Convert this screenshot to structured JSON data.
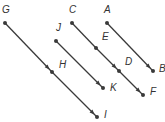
{
  "diagram": {
    "type": "parallel-directed-segments",
    "colors": {
      "line": "#3a3a3a",
      "label": "#333333",
      "background": "#ffffff"
    },
    "points": {
      "A": {
        "x": 107,
        "y": 23,
        "label": "A",
        "lx": 104,
        "ly": 13
      },
      "B": {
        "x": 153,
        "y": 71,
        "label": "B",
        "lx": 159,
        "ly": 72
      },
      "C": {
        "x": 72,
        "y": 23,
        "label": "C",
        "lx": 69,
        "ly": 13
      },
      "E": {
        "x": 96,
        "y": 48,
        "label": "E",
        "lx": 102,
        "ly": 40
      },
      "D": {
        "x": 119,
        "y": 71,
        "label": "D",
        "lx": 125,
        "ly": 65
      },
      "F": {
        "x": 143,
        "y": 95,
        "label": "F",
        "lx": 150,
        "ly": 95
      },
      "J": {
        "x": 56,
        "y": 41,
        "label": "J",
        "lx": 56,
        "ly": 31
      },
      "K": {
        "x": 103,
        "y": 88,
        "label": "K",
        "lx": 110,
        "ly": 91
      },
      "G": {
        "x": 5,
        "y": 23,
        "label": "G",
        "lx": 2,
        "ly": 13
      },
      "H": {
        "x": 52,
        "y": 72,
        "label": "H",
        "lx": 59,
        "ly": 68
      },
      "I": {
        "x": 97,
        "y": 117,
        "label": "I",
        "lx": 104,
        "ly": 118
      }
    },
    "vectors": [
      {
        "name": "vector-AB",
        "from": "A",
        "to": "B",
        "arrow_at": "end"
      },
      {
        "name": "vector-CE",
        "from": "C",
        "to": "E",
        "arrow_at": "none"
      },
      {
        "name": "vector-ED",
        "from": "E",
        "to": "D",
        "arrow_at": "end"
      },
      {
        "name": "vector-DF",
        "from": "D",
        "to": "F",
        "arrow_at": "end"
      },
      {
        "name": "vector-JK",
        "from": "J",
        "to": "K",
        "arrow_at": "end"
      },
      {
        "name": "vector-GH",
        "from": "G",
        "to": "H",
        "arrow_at": "end"
      },
      {
        "name": "vector-HI",
        "from": "H",
        "to": "I",
        "arrow_at": "end"
      }
    ]
  }
}
